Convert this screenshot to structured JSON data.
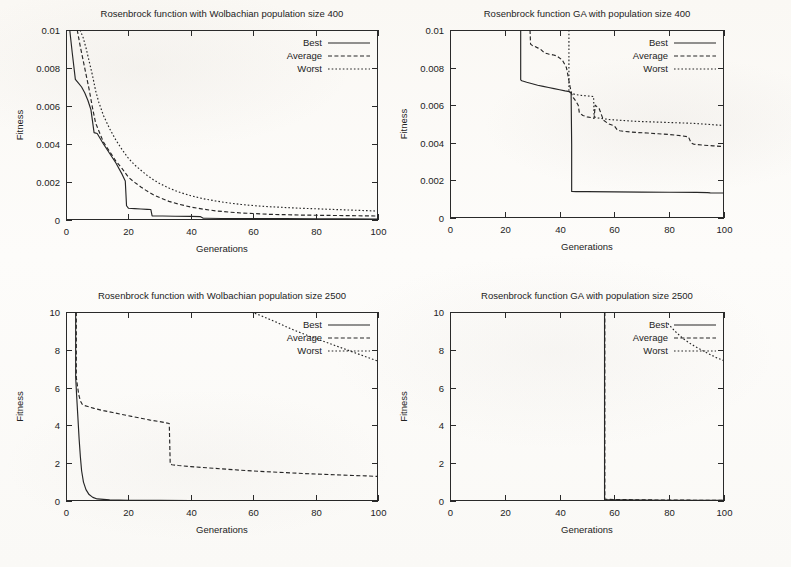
{
  "figure": {
    "caption_none": "",
    "axis": {
      "xlabel": "Generations",
      "ylabel": "Fitness"
    },
    "legend_entries": [
      "Best",
      "Average",
      "Worst"
    ]
  },
  "chart_data": [
    {
      "id": "wolbachian-400",
      "type": "line",
      "title": "Rosenbrock function with Wolbachian population size 400",
      "xlabel": "Generations",
      "ylabel": "Fitness",
      "xlim": [
        0,
        100
      ],
      "ylim": [
        0,
        0.01
      ],
      "xticks": [
        0,
        20,
        40,
        60,
        80,
        100
      ],
      "yticks": [
        0,
        0.002,
        0.004,
        0.006,
        0.008,
        0.01
      ],
      "xticklabels": [
        "0",
        "20",
        "40",
        "60",
        "80",
        "100"
      ],
      "yticklabels": [
        "0",
        "0.002",
        "0.004",
        "0.006",
        "0.008",
        "0.01"
      ],
      "grid": false,
      "legend": [
        "Best",
        "Average",
        "Worst"
      ],
      "legend_position": "top-right-inside",
      "series": [
        {
          "name": "Best",
          "style": "solid",
          "x": [
            1.2,
            2.0,
            3.0,
            4.0,
            5.0,
            6.0,
            7.0,
            8.0,
            9.0,
            10.0,
            12.0,
            14.0,
            16.0,
            18.0,
            19.0,
            19.4,
            20.0,
            22.0,
            24.0,
            26.0,
            27.2,
            27.6,
            28.5,
            31.0,
            35.0,
            40.0,
            43.0,
            44.0,
            45.0,
            50.0,
            60.0,
            70.0,
            80.0,
            90.0,
            100.0
          ],
          "y": [
            0.01,
            0.0088,
            0.0074,
            0.0072,
            0.007,
            0.0067,
            0.0063,
            0.0058,
            0.0046,
            0.00455,
            0.004,
            0.0035,
            0.003,
            0.0024,
            0.00205,
            0.00075,
            0.00062,
            0.0006,
            0.00058,
            0.00056,
            0.00055,
            0.00022,
            0.00021,
            0.00021,
            0.0002,
            0.00019,
            0.00018,
            9e-05,
            9e-05,
            8e-05,
            7e-05,
            7e-05,
            6e-05,
            6e-05,
            5e-05
          ]
        },
        {
          "name": "Average",
          "style": "dashed",
          "x": [
            3.6,
            4.5,
            5.5,
            6.5,
            7.5,
            8.5,
            9.5,
            10.5,
            12.0,
            14.0,
            16.0,
            18.0,
            20.0,
            22.0,
            24.0,
            26.0,
            28.0,
            30.0,
            33.0,
            36.0,
            40.0,
            44.0,
            48.0,
            52.0,
            56.0,
            60.0,
            65.0,
            70.0,
            75.0,
            80.0,
            85.0,
            90.0,
            95.0,
            100.0
          ],
          "y": [
            0.01,
            0.0092,
            0.0084,
            0.0076,
            0.0068,
            0.0059,
            0.0051,
            0.0047,
            0.0041,
            0.0036,
            0.0031,
            0.0027,
            0.00225,
            0.00198,
            0.00174,
            0.00152,
            0.00133,
            0.00118,
            0.00098,
            0.00084,
            0.00068,
            0.00057,
            0.00048,
            0.00042,
            0.00037,
            0.00034,
            0.0003,
            0.00028,
            0.00026,
            0.00025,
            0.00024,
            0.00023,
            0.00022,
            0.00021
          ]
        },
        {
          "name": "Worst",
          "style": "dotted",
          "x": [
            4.5,
            5.5,
            6.5,
            7.5,
            8.5,
            9.5,
            10.5,
            12.0,
            14.0,
            16.0,
            18.0,
            20.0,
            22.0,
            24.0,
            26.0,
            28.0,
            30.0,
            33.0,
            36.0,
            40.0,
            44.0,
            48.0,
            52.0,
            56.0,
            60.0,
            65.0,
            70.0,
            75.0,
            80.0,
            85.0,
            90.0,
            95.0,
            100.0
          ],
          "y": [
            0.01,
            0.0096,
            0.009,
            0.0083,
            0.0076,
            0.0068,
            0.0062,
            0.0055,
            0.0048,
            0.0042,
            0.0037,
            0.00325,
            0.0029,
            0.00262,
            0.00235,
            0.00212,
            0.00192,
            0.00168,
            0.00148,
            0.00128,
            0.00112,
            0.001,
            0.0009,
            0.00082,
            0.00076,
            0.0007,
            0.00066,
            0.00062,
            0.00059,
            0.00056,
            0.00053,
            0.0005,
            0.00047
          ]
        }
      ]
    },
    {
      "id": "ga-400",
      "type": "line",
      "title": "Rosenbrock function GA with  population size 400",
      "xlabel": "Generations",
      "ylabel": "Fitness",
      "xlim": [
        0,
        100
      ],
      "ylim": [
        0,
        0.01
      ],
      "xticks": [
        0,
        20,
        40,
        60,
        80,
        100
      ],
      "yticks": [
        0,
        0.002,
        0.004,
        0.006,
        0.008,
        0.01
      ],
      "xticklabels": [
        "0",
        "20",
        "40",
        "60",
        "80",
        "100"
      ],
      "yticklabels": [
        "0",
        "0.002",
        "0.004",
        "0.006",
        "0.008",
        "0.01"
      ],
      "grid": false,
      "legend": [
        "Best",
        "Average",
        "Worst"
      ],
      "legend_position": "top-right-inside",
      "series": [
        {
          "name": "Best",
          "style": "solid",
          "x": [
            25.8,
            25.8,
            26.2,
            28.0,
            30.0,
            32.0,
            34.0,
            36.0,
            38.0,
            40.0,
            42.0,
            43.6,
            43.8,
            44.2,
            44.4,
            44.4,
            46.0,
            50.0,
            60.0,
            70.0,
            80.0,
            90.0,
            94.0,
            95.0,
            100.0
          ],
          "y": [
            0.01,
            0.00735,
            0.0073,
            0.00722,
            0.00714,
            0.00706,
            0.007,
            0.00694,
            0.00688,
            0.00682,
            0.00676,
            0.00672,
            0.00668,
            0.00668,
            0.0039,
            0.00141,
            0.0014,
            0.0014,
            0.00139,
            0.00138,
            0.00137,
            0.00136,
            0.00135,
            0.00134,
            0.00133
          ]
        },
        {
          "name": "Average",
          "style": "dashed",
          "x": [
            29.2,
            29.4,
            30.0,
            31.0,
            32.0,
            33.0,
            34.5,
            36.0,
            37.5,
            39.0,
            41.0,
            42.5,
            43.8,
            44.4,
            45.0,
            46.0,
            46.8,
            47.2,
            48.5,
            50.0,
            51.5,
            52.6,
            53.0,
            54.5,
            56.0,
            58.0,
            60.0,
            61.0,
            62.0,
            64.0,
            68.0,
            72.0,
            76.0,
            80.0,
            84.0,
            87.0,
            88.0,
            89.0,
            92.0,
            96.0,
            100.0
          ],
          "y": [
            0.01,
            0.00925,
            0.00918,
            0.00912,
            0.00905,
            0.00898,
            0.00878,
            0.00872,
            0.00868,
            0.00862,
            0.0084,
            0.008,
            0.007,
            0.0066,
            0.0064,
            0.0062,
            0.006,
            0.0056,
            0.00545,
            0.00538,
            0.00534,
            0.0053,
            0.006,
            0.0058,
            0.0052,
            0.005,
            0.0049,
            0.0047,
            0.00464,
            0.0046,
            0.00455,
            0.00452,
            0.00448,
            0.00444,
            0.00438,
            0.00432,
            0.004,
            0.00392,
            0.00388,
            0.00384,
            0.0038
          ]
        },
        {
          "name": "Worst",
          "style": "dotted",
          "x": [
            43.4,
            43.4,
            44.0,
            45.0,
            46.0,
            47.0,
            48.0,
            49.5,
            51.0,
            52.4,
            52.6,
            53.0,
            54.0,
            56.0,
            58.0,
            60.0,
            64.0,
            68.0,
            72.0,
            76.0,
            80.0,
            84.0,
            88.0,
            92.0,
            96.0,
            100.0
          ],
          "y": [
            0.01,
            0.00672,
            0.00666,
            0.0066,
            0.00656,
            0.00654,
            0.00652,
            0.0065,
            0.00648,
            0.00646,
            0.0054,
            0.00536,
            0.00532,
            0.00528,
            0.00524,
            0.00522,
            0.00518,
            0.00514,
            0.00512,
            0.0051,
            0.00508,
            0.00506,
            0.00504,
            0.005,
            0.00496,
            0.00492
          ]
        }
      ]
    },
    {
      "id": "wolbachian-2500",
      "type": "line",
      "title": "Rosenbrock function with Wolbachian population size 2500",
      "xlabel": "Generations",
      "ylabel": "Fitness",
      "xlim": [
        0,
        100
      ],
      "ylim": [
        0,
        10
      ],
      "xticks": [
        0,
        20,
        40,
        60,
        80,
        100
      ],
      "yticks": [
        0,
        2,
        4,
        6,
        8,
        10
      ],
      "xticklabels": [
        "0",
        "20",
        "40",
        "60",
        "80",
        "100"
      ],
      "yticklabels": [
        "0",
        "2",
        "4",
        "6",
        "8",
        "10"
      ],
      "grid": false,
      "legend": [
        "Best",
        "Average",
        "Worst"
      ],
      "legend_position": "top-right-inside",
      "series": [
        {
          "name": "Best",
          "style": "solid",
          "x": [
            3.1,
            3.1,
            3.4,
            3.8,
            4.2,
            4.6,
            5.0,
            5.6,
            6.4,
            7.4,
            8.6,
            10.0,
            14.0,
            20.0,
            30.0,
            40.0,
            55.0,
            70.0,
            85.0,
            100.0
          ],
          "y": [
            10.0,
            6.55,
            5.6,
            4.45,
            3.3,
            2.35,
            1.6,
            1.0,
            0.6,
            0.34,
            0.19,
            0.11,
            0.06,
            0.04,
            0.03,
            0.025,
            0.02,
            0.018,
            0.015,
            0.012
          ]
        },
        {
          "name": "Average",
          "style": "dashed",
          "x": [
            3.3,
            3.3,
            3.7,
            4.1,
            4.6,
            5.2,
            6.0,
            7.0,
            8.0,
            9.0,
            10.0,
            12.0,
            15.0,
            18.0,
            21.0,
            24.0,
            27.0,
            30.0,
            32.0,
            33.1,
            33.4,
            34.0,
            36.0,
            40.0,
            45.0,
            50.0,
            56.0,
            62.0,
            68.0,
            74.0,
            80.0,
            86.0,
            92.0,
            96.0,
            100.0
          ],
          "y": [
            10.0,
            6.55,
            6.05,
            5.62,
            5.3,
            5.12,
            5.05,
            5.0,
            4.95,
            4.9,
            4.86,
            4.78,
            4.68,
            4.58,
            4.48,
            4.38,
            4.28,
            4.2,
            4.14,
            4.1,
            1.95,
            1.92,
            1.88,
            1.82,
            1.76,
            1.7,
            1.63,
            1.57,
            1.52,
            1.47,
            1.43,
            1.39,
            1.35,
            1.33,
            1.3
          ]
        },
        {
          "name": "Worst",
          "style": "dotted",
          "x": [
            59.4,
            60.0,
            62.0,
            64.0,
            66.0,
            68.0,
            70.0,
            74.0,
            78.0,
            82.0,
            86.0,
            90.0,
            94.0,
            97.0,
            100.0
          ],
          "y": [
            10.0,
            9.96,
            9.84,
            9.7,
            9.56,
            9.42,
            9.26,
            8.98,
            8.72,
            8.48,
            8.24,
            8.0,
            7.76,
            7.58,
            7.4
          ]
        }
      ]
    },
    {
      "id": "ga-2500",
      "type": "line",
      "title": "Rosenbrock function GA with  population size 2500",
      "xlabel": "Generations",
      "ylabel": "Fitness",
      "xlim": [
        0,
        100
      ],
      "ylim": [
        0,
        10
      ],
      "xticks": [
        0,
        20,
        40,
        60,
        80,
        100
      ],
      "yticks": [
        0,
        2,
        4,
        6,
        8,
        10
      ],
      "xticklabels": [
        "0",
        "20",
        "40",
        "60",
        "80",
        "100"
      ],
      "yticklabels": [
        "0",
        "2",
        "4",
        "6",
        "8",
        "10"
      ],
      "grid": false,
      "legend": [
        "Best",
        "Average",
        "Worst"
      ],
      "legend_position": "top-right-inside",
      "series": [
        {
          "name": "Best",
          "style": "solid",
          "x": [
            56.4,
            56.4,
            56.6,
            60.0,
            70.0,
            80.0,
            90.0,
            100.0
          ],
          "y": [
            10.0,
            0.08,
            0.07,
            0.06,
            0.05,
            0.04,
            0.035,
            0.03
          ]
        },
        {
          "name": "Average",
          "style": "dashed",
          "x": [
            56.5,
            56.5,
            57.0,
            60.0,
            70.0,
            80.0,
            90.0,
            100.0
          ],
          "y": [
            10.0,
            0.1,
            0.09,
            0.08,
            0.06,
            0.05,
            0.04,
            0.035
          ]
        },
        {
          "name": "Worst",
          "style": "dotted",
          "x": [
            79.5,
            82.0,
            85.0,
            88.0,
            91.0,
            94.0,
            97.0,
            100.0
          ],
          "y": [
            9.4,
            9.0,
            8.6,
            8.3,
            8.05,
            7.82,
            7.6,
            7.42
          ]
        }
      ]
    }
  ]
}
